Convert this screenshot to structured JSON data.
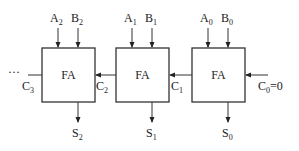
{
  "diagram": {
    "type": "ripple-carry-adder",
    "blocks": [
      {
        "label": "FA",
        "inputs": {
          "a": "A",
          "a_sub": "2",
          "b": "B",
          "b_sub": "2"
        },
        "sum": "S",
        "sum_sub": "2",
        "carry_out": "C",
        "carry_out_sub": "3"
      },
      {
        "label": "FA",
        "inputs": {
          "a": "A",
          "a_sub": "1",
          "b": "B",
          "b_sub": "1"
        },
        "sum": "S",
        "sum_sub": "1",
        "carry_out": "C",
        "carry_out_sub": "2"
      },
      {
        "label": "FA",
        "inputs": {
          "a": "A",
          "a_sub": "0",
          "b": "B",
          "b_sub": "0"
        },
        "sum": "S",
        "sum_sub": "0",
        "carry_out": "C",
        "carry_out_sub": "1"
      }
    ],
    "carry_in": {
      "label": "C",
      "sub": "0",
      "value": "=0"
    },
    "continuation": "···"
  }
}
